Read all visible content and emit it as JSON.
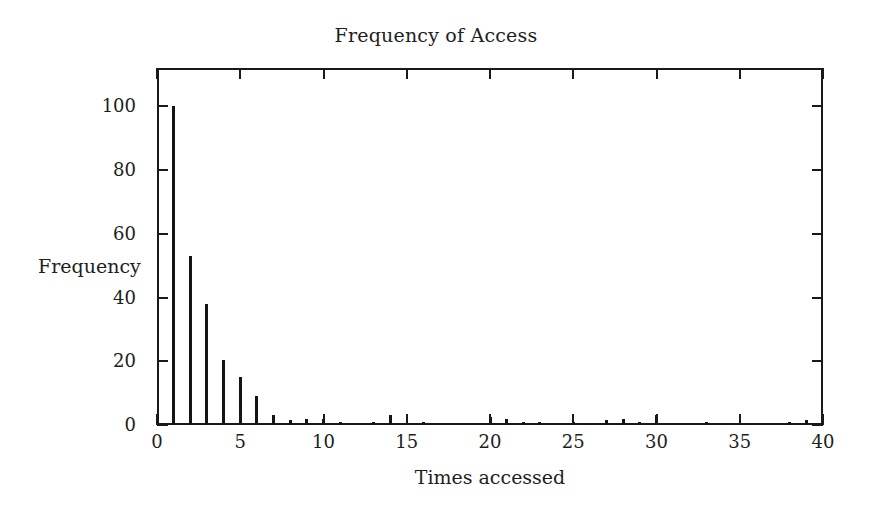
{
  "chart_data": {
    "type": "bar",
    "title": "Frequency of Access",
    "xlabel": "Times accessed",
    "ylabel": "Frequency",
    "xlim": [
      0,
      40
    ],
    "ylim": [
      0,
      112
    ],
    "grid": false,
    "legend": null,
    "xticks": [
      0,
      5,
      10,
      15,
      20,
      25,
      30,
      35,
      40
    ],
    "xtick_labels": [
      "0",
      "5",
      "10",
      "15",
      "20",
      "25",
      "30",
      "35",
      "40"
    ],
    "yticks": [
      0,
      20,
      40,
      60,
      80,
      100
    ],
    "ytick_labels": [
      "0",
      "20",
      "40",
      "60",
      "80",
      "100"
    ],
    "x": [
      1,
      2,
      3,
      4,
      5,
      6,
      7,
      8,
      9,
      10,
      11,
      13,
      14,
      16,
      20,
      21,
      22,
      23,
      25,
      27,
      28,
      29,
      30,
      33,
      38,
      39
    ],
    "values": [
      100,
      53,
      38,
      20.5,
      15,
      9,
      3,
      1.5,
      2,
      2,
      1,
      1,
      3,
      1,
      2.5,
      2,
      1,
      1,
      1,
      1.5,
      2,
      1,
      3,
      1,
      1,
      1.5
    ],
    "series": [
      {
        "name": "Frequency",
        "color": "#141414",
        "points": [
          {
            "x": 1,
            "y": 100
          },
          {
            "x": 2,
            "y": 53
          },
          {
            "x": 3,
            "y": 38
          },
          {
            "x": 4,
            "y": 20.5
          },
          {
            "x": 5,
            "y": 15
          },
          {
            "x": 6,
            "y": 9
          },
          {
            "x": 7,
            "y": 3
          },
          {
            "x": 8,
            "y": 1.5
          },
          {
            "x": 9,
            "y": 2
          },
          {
            "x": 10,
            "y": 2
          },
          {
            "x": 11,
            "y": 1
          },
          {
            "x": 13,
            "y": 1
          },
          {
            "x": 14,
            "y": 3
          },
          {
            "x": 16,
            "y": 1
          },
          {
            "x": 20,
            "y": 2.5
          },
          {
            "x": 21,
            "y": 2
          },
          {
            "x": 22,
            "y": 1
          },
          {
            "x": 23,
            "y": 1
          },
          {
            "x": 25,
            "y": 1
          },
          {
            "x": 27,
            "y": 1.5
          },
          {
            "x": 28,
            "y": 2
          },
          {
            "x": 29,
            "y": 1
          },
          {
            "x": 30,
            "y": 3
          },
          {
            "x": 33,
            "y": 1
          },
          {
            "x": 38,
            "y": 1
          },
          {
            "x": 39,
            "y": 1.5
          }
        ]
      }
    ]
  },
  "colors": {
    "bar": "#141414",
    "axis": "#1a1a1a",
    "text": "#1e1e1e",
    "background": "#ffffff"
  }
}
